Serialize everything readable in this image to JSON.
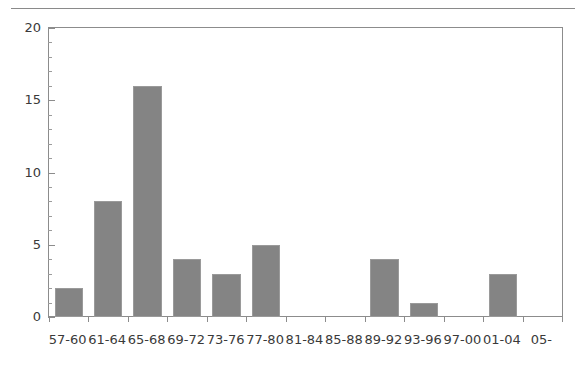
{
  "chart_data": {
    "type": "bar",
    "title": "",
    "subtitle": "",
    "xlabel": "",
    "ylabel": "",
    "categories": [
      "57-60",
      "61-64",
      "65-68",
      "69-72",
      "73-76",
      "77-80",
      "81-84",
      "85-88",
      "89-92",
      "93-96",
      "97-00",
      "01-04",
      "05-"
    ],
    "values": [
      2,
      8,
      16,
      4,
      3,
      5,
      0,
      0,
      4,
      1,
      0,
      3,
      0
    ],
    "ylim": [
      0,
      20
    ],
    "xlim_categories": 13,
    "y_major_ticks": [
      0,
      5,
      10,
      15,
      20
    ],
    "y_major_tick_labels": [
      "0",
      "5",
      "10",
      "15",
      "20"
    ],
    "y_minor_tick_step": 1,
    "grid": false,
    "legend": null,
    "legend_position": "none",
    "annotations": [],
    "bar_color": "#848484",
    "bar_edge_color": "#9a9a9a",
    "axis_color": "#8c8c8c",
    "text_color": "#3a3a3a",
    "background_color": "#ffffff",
    "has_top_rule": true
  }
}
